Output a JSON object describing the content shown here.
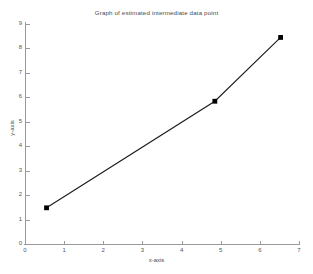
{
  "chart_data": {
    "type": "line",
    "title": "Graph of estimated intermediate data point",
    "xlabel": "x-axis",
    "ylabel": "y-axis",
    "xlim": [
      0,
      7
    ],
    "ylim": [
      0,
      9
    ],
    "grid": false,
    "legend": null,
    "xticks": [
      0,
      1,
      2,
      3,
      4,
      5,
      6,
      7
    ],
    "yticks": [
      0,
      1,
      2,
      3,
      4,
      5,
      6,
      7,
      8,
      9
    ],
    "series": [
      {
        "name": "estimated intermediate data point",
        "marker": "filled-square",
        "line_color": "#1a1a1a",
        "marker_color": "#000000",
        "x": [
          0.55,
          4.85,
          6.53
        ],
        "y": [
          1.48,
          5.84,
          8.45
        ],
        "points": [
          {
            "label": "known point 1",
            "x": 0.55,
            "y": 1.48
          },
          {
            "label": "estimated intermediate point",
            "x": 4.85,
            "y": 5.84
          },
          {
            "label": "known point 2",
            "x": 6.53,
            "y": 8.45
          }
        ]
      }
    ]
  },
  "axes": {
    "x_tick_labels": [
      "0",
      "1",
      "2",
      "3",
      "4",
      "5",
      "6",
      "7"
    ],
    "y_tick_labels": [
      "0",
      "1",
      "2",
      "3",
      "4",
      "5",
      "6",
      "7",
      "8",
      "9"
    ]
  },
  "colors": {
    "axis": "#9a9a9a",
    "line": "#1a1a1a",
    "marker": "#000000",
    "text": "#4a4a4a",
    "background": "#ffffff"
  }
}
